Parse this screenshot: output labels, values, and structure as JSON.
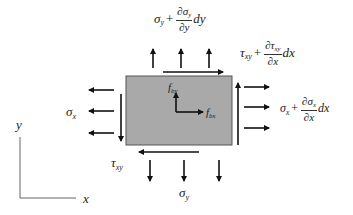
{
  "diagram": {
    "colors": {
      "element_fill": "#a9a9a9",
      "element_stroke": "#555555",
      "arrow": "#111111",
      "axis": "#666666",
      "text": "#222222"
    },
    "element": {
      "x": 126,
      "y": 76,
      "width": 106,
      "height": 69
    },
    "axes": {
      "x_label": "x",
      "y_label": "y"
    },
    "labels": {
      "sigma_y_top": {
        "base": "σ",
        "sub": "y",
        "plus": "+",
        "num": "∂σ",
        "num_sub": "y",
        "den": "∂y",
        "tail": "dy"
      },
      "tau_xy_top": {
        "base": "τ",
        "sub": "xy",
        "plus": "+",
        "num": "∂τ",
        "num_sub": "xy",
        "den": "∂x",
        "tail": "dx"
      },
      "sigma_x_right": {
        "base": "σ",
        "sub": "x",
        "plus": "+",
        "num": "∂σ",
        "num_sub": "x",
        "den": "∂x",
        "tail": "dx"
      },
      "sigma_x_left": {
        "base": "σ",
        "sub": "x"
      },
      "tau_xy_bottom": {
        "base": "τ",
        "sub": "xy"
      },
      "sigma_y_bottom": {
        "base": "σ",
        "sub": "y"
      },
      "f_by": {
        "base": "f",
        "sub": "by"
      },
      "f_bx": {
        "base": "f",
        "sub": "bx"
      }
    },
    "arrows": {
      "top_normal_x": [
        153,
        181,
        209
      ],
      "bottom_normal_x": [
        150,
        184,
        219
      ],
      "left_normal_y": [
        90,
        111,
        133
      ],
      "right_normal_y": [
        87,
        107,
        128
      ]
    }
  }
}
